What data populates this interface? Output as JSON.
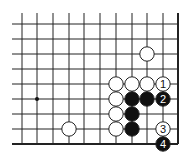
{
  "diagram": {
    "type": "go-board-fragment",
    "grid": {
      "x_lines": [
        22,
        37,
        53,
        69,
        84,
        100,
        116,
        132,
        147,
        163,
        178
      ],
      "y_lines": [
        24,
        39,
        54,
        69,
        84,
        99,
        114,
        129,
        144
      ],
      "right_edge": true,
      "bottom_edge": true,
      "line_color": "#222222"
    },
    "star_points": [
      {
        "col": 1,
        "row": 5
      }
    ],
    "stones": [
      {
        "color": "white",
        "col": 8,
        "row": 2,
        "label": ""
      },
      {
        "color": "white",
        "col": 6,
        "row": 4,
        "label": ""
      },
      {
        "color": "white",
        "col": 7,
        "row": 4,
        "label": ""
      },
      {
        "color": "white",
        "col": 8,
        "row": 4,
        "label": ""
      },
      {
        "color": "white",
        "col": 9,
        "row": 4,
        "label": "1"
      },
      {
        "color": "white",
        "col": 6,
        "row": 5,
        "label": ""
      },
      {
        "color": "black",
        "col": 7,
        "row": 5,
        "label": ""
      },
      {
        "color": "black",
        "col": 8,
        "row": 5,
        "label": ""
      },
      {
        "color": "black",
        "col": 9,
        "row": 5,
        "label": "2"
      },
      {
        "color": "white",
        "col": 6,
        "row": 6,
        "label": ""
      },
      {
        "color": "black",
        "col": 7,
        "row": 6,
        "label": ""
      },
      {
        "color": "white",
        "col": 3,
        "row": 7,
        "label": ""
      },
      {
        "color": "white",
        "col": 6,
        "row": 7,
        "label": ""
      },
      {
        "color": "black",
        "col": 7,
        "row": 7,
        "label": ""
      },
      {
        "color": "white",
        "col": 9,
        "row": 7,
        "label": "3"
      },
      {
        "color": "black",
        "col": 9,
        "row": 8,
        "label": "4"
      }
    ]
  }
}
